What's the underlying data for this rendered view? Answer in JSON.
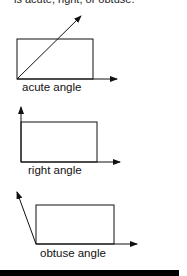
{
  "header": {
    "clipped_text": "is acute, right, or obtuse."
  },
  "figures": [
    {
      "label": "acute angle",
      "type": "acute"
    },
    {
      "label": "right angle",
      "type": "right"
    },
    {
      "label": "obtuse angle",
      "type": "obtuse"
    }
  ],
  "colors": {
    "line": "#111111",
    "background": "#ffffff",
    "bottom_bar": "#000000"
  }
}
